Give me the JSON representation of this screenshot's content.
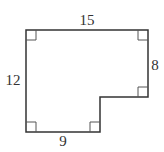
{
  "diagram": {
    "type": "rectilinear-polygon",
    "stroke_color": "#333333",
    "background": "#ffffff",
    "labels": {
      "top": "15",
      "left": "12",
      "right": "8",
      "bottom": "9"
    },
    "vertices": [
      [
        26,
        30
      ],
      [
        148,
        30
      ],
      [
        148,
        97
      ],
      [
        100,
        97
      ],
      [
        100,
        132
      ],
      [
        26,
        132
      ]
    ],
    "right_angle_markers": [
      "top-left",
      "top-right",
      "right-bottom",
      "bottom-inner",
      "bottom-left"
    ]
  }
}
